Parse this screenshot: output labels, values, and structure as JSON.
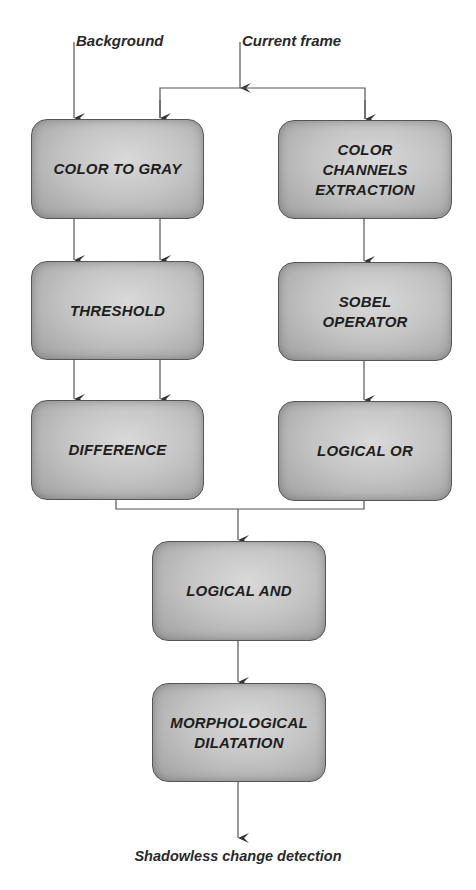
{
  "diagram": {
    "inputs": {
      "background": "Background",
      "current_frame": "Current frame"
    },
    "output": "Shadowless change detection",
    "nodes": [
      {
        "id": "color_to_gray",
        "label": "COLOR TO GRAY"
      },
      {
        "id": "color_channels_extraction",
        "label": "COLOR\nCHANNELS\nEXTRACTION"
      },
      {
        "id": "threshold",
        "label": "THRESHOLD"
      },
      {
        "id": "sobel_operator",
        "label": "SOBEL\nOPERATOR"
      },
      {
        "id": "difference",
        "label": "DIFFERENCE"
      },
      {
        "id": "logical_or",
        "label": "LOGICAL OR"
      },
      {
        "id": "logical_and",
        "label": "LOGICAL AND"
      },
      {
        "id": "morphological_dilatation",
        "label": "MORPHOLOGICAL\nDILATATION"
      }
    ],
    "edges": [
      {
        "from": "Background",
        "to": "color_to_gray"
      },
      {
        "from": "Current frame",
        "to": "color_to_gray"
      },
      {
        "from": "Current frame",
        "to": "color_channels_extraction"
      },
      {
        "from": "color_to_gray",
        "to": "threshold",
        "count": 2
      },
      {
        "from": "threshold",
        "to": "difference",
        "count": 2
      },
      {
        "from": "color_channels_extraction",
        "to": "sobel_operator"
      },
      {
        "from": "sobel_operator",
        "to": "logical_or"
      },
      {
        "from": "difference",
        "to": "logical_and"
      },
      {
        "from": "logical_or",
        "to": "logical_and"
      },
      {
        "from": "logical_and",
        "to": "morphological_dilatation"
      },
      {
        "from": "morphological_dilatation",
        "to": "Shadowless change detection"
      }
    ],
    "colors": {
      "box_fill": "#c4c4c4",
      "box_border": "#555555",
      "line": "#555555",
      "text": "#1e1e1e"
    }
  }
}
